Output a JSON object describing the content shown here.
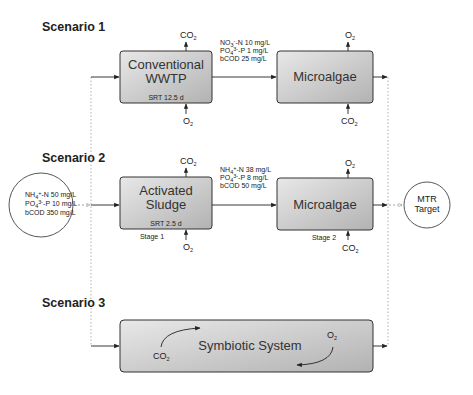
{
  "scenarios": [
    {
      "label": "Scenario 1",
      "stage1": {
        "title_line1": "Conventional",
        "title_line2": "WWTP",
        "srt": "SRT 12.5 d",
        "top_gas": "CO",
        "top_gas_sub": "2",
        "bottom_gas": "O",
        "bottom_gas_sub": "2"
      },
      "effluent": {
        "line1_a": "NO",
        "line1_sub": "3",
        "line1_sup": "-",
        "line1_b": "-N 10 mg/L",
        "line2_a": "PO",
        "line2_sub": "4",
        "line2_sup": "3-",
        "line2_b": "-P 1 mg/L",
        "line3": "bCOD 25 mg/L"
      },
      "stage2": {
        "title": "Microalgae",
        "top_gas": "O",
        "top_gas_sub": "2",
        "bottom_gas": "CO",
        "bottom_gas_sub": "2"
      }
    },
    {
      "label": "Scenario 2",
      "stage1": {
        "title_line1": "Activated",
        "title_line2": "Sludge",
        "srt": "SRT 2.5 d",
        "stage_label": "Stage 1",
        "top_gas": "CO",
        "top_gas_sub": "2",
        "bottom_gas": "O",
        "bottom_gas_sub": "2"
      },
      "effluent": {
        "line1_a": "NH",
        "line1_sub": "4",
        "line1_sup": "+",
        "line1_b": "-N 38 mg/L",
        "line2_a": "PO",
        "line2_sub": "4",
        "line2_sup": "3-",
        "line2_b": "-P 8 mg/L",
        "line3": "bCOD 50 mg/L"
      },
      "stage2": {
        "title": "Microalgae",
        "stage_label": "Stage 2",
        "top_gas": "O",
        "top_gas_sub": "2",
        "bottom_gas": "CO",
        "bottom_gas_sub": "2"
      }
    },
    {
      "label": "Scenario 3",
      "system": {
        "title": "Symbiotic System",
        "left_gas": "CO",
        "left_gas_sub": "2",
        "right_gas": "O",
        "right_gas_sub": "2"
      }
    }
  ],
  "influent": {
    "line1_a": "NH",
    "line1_sub": "4",
    "line1_sup": "+",
    "line1_b": "-N 50 mg/L",
    "line2_a": "PO",
    "line2_sub": "4",
    "line2_sup": "3-",
    "line2_b": "-P 10 mg/L",
    "line3": "bCOD 350 mg/L"
  },
  "target": {
    "line1": "MTR",
    "line2": "Target"
  },
  "colors": {
    "box_fill_top": "#e6e6e6",
    "box_fill_bottom": "#b4b4b4",
    "stroke": "#333333",
    "dotted": "#9a9a9a"
  }
}
